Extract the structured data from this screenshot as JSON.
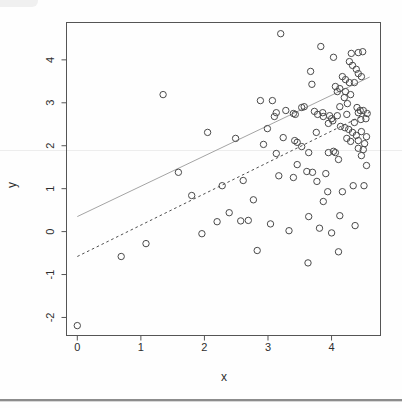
{
  "chart_data": {
    "type": "scatter",
    "title": "",
    "xlabel": "x",
    "ylabel": "y",
    "marker": "open-circle",
    "marker_color": "#4a4a4a",
    "axis_color": "#555555",
    "text_color": "#2e2e2e",
    "grid": false,
    "legend": false,
    "xlim": [
      -0.17,
      4.77
    ],
    "ylim": [
      -2.42,
      4.87
    ],
    "x_ticks": [
      0,
      1,
      2,
      3,
      4
    ],
    "x_tick_labels": [
      "0",
      "1",
      "2",
      "3",
      "4"
    ],
    "y_ticks": [
      -2,
      -1,
      0,
      1,
      2,
      3,
      4
    ],
    "y_tick_labels": [
      "-2",
      "-1",
      "0",
      "1",
      "2",
      "3",
      "4"
    ],
    "lines": [
      {
        "name": "solid-line",
        "style": "solid",
        "color": "#9a9a9a",
        "width": 0.9,
        "from": [
          0.0,
          0.35
        ],
        "to": [
          4.6,
          3.6
        ]
      },
      {
        "name": "dashed-line",
        "style": "dashed",
        "color": "#4f4f4f",
        "width": 1.0,
        "dash": "2.6,2.8",
        "from": [
          0.0,
          -0.58
        ],
        "to": [
          4.6,
          2.78
        ]
      }
    ],
    "points": [
      [
        0.0,
        -2.19
      ],
      [
        0.69,
        -0.58
      ],
      [
        1.08,
        -0.28
      ],
      [
        1.35,
        3.19
      ],
      [
        1.59,
        1.38
      ],
      [
        1.8,
        0.84
      ],
      [
        1.96,
        -0.05
      ],
      [
        2.05,
        2.31
      ],
      [
        2.2,
        0.23
      ],
      [
        2.28,
        1.07
      ],
      [
        2.39,
        0.44
      ],
      [
        2.49,
        2.17
      ],
      [
        2.57,
        0.25
      ],
      [
        2.61,
        1.19
      ],
      [
        2.69,
        0.26
      ],
      [
        2.77,
        0.74
      ],
      [
        2.83,
        -0.44
      ],
      [
        2.88,
        3.05
      ],
      [
        2.93,
        2.03
      ],
      [
        2.99,
        2.4
      ],
      [
        3.04,
        0.18
      ],
      [
        3.07,
        3.05
      ],
      [
        3.1,
        2.68
      ],
      [
        3.13,
        2.77
      ],
      [
        3.13,
        1.82
      ],
      [
        3.17,
        1.3
      ],
      [
        3.2,
        4.61
      ],
      [
        3.24,
        2.19
      ],
      [
        3.28,
        2.82
      ],
      [
        3.33,
        0.02
      ],
      [
        3.4,
        2.75
      ],
      [
        3.4,
        1.26
      ],
      [
        3.42,
        2.12
      ],
      [
        3.43,
        2.73
      ],
      [
        3.46,
        2.08
      ],
      [
        3.46,
        1.56
      ],
      [
        3.53,
        2.89
      ],
      [
        3.53,
        1.98
      ],
      [
        3.57,
        2.91
      ],
      [
        3.61,
        1.4
      ],
      [
        3.63,
        -0.73
      ],
      [
        3.64,
        1.84
      ],
      [
        3.64,
        0.35
      ],
      [
        3.67,
        3.73
      ],
      [
        3.69,
        3.43
      ],
      [
        3.7,
        1.38
      ],
      [
        3.73,
        2.8
      ],
      [
        3.76,
        2.31
      ],
      [
        3.77,
        1.17
      ],
      [
        3.78,
        2.73
      ],
      [
        3.81,
        0.08
      ],
      [
        3.83,
        4.31
      ],
      [
        3.86,
        2.77
      ],
      [
        3.87,
        2.68
      ],
      [
        3.87,
        0.7
      ],
      [
        3.91,
        1.35
      ],
      [
        3.94,
        0.93
      ],
      [
        3.95,
        1.84
      ],
      [
        3.95,
        2.52
      ],
      [
        3.97,
        2.7
      ],
      [
        4.0,
        -0.03
      ],
      [
        4.0,
        2.63
      ],
      [
        4.02,
        2.58
      ],
      [
        4.03,
        1.87
      ],
      [
        4.03,
        4.06
      ],
      [
        4.06,
        3.38
      ],
      [
        4.06,
        1.84
      ],
      [
        4.09,
        3.26
      ],
      [
        4.09,
        2.7
      ],
      [
        4.11,
        1.68
      ],
      [
        4.11,
        -0.47
      ],
      [
        4.13,
        0.37
      ],
      [
        4.13,
        2.91
      ],
      [
        4.13,
        3.33
      ],
      [
        4.14,
        2.45
      ],
      [
        4.17,
        0.93
      ],
      [
        4.17,
        3.61
      ],
      [
        4.2,
        3.12
      ],
      [
        4.21,
        2.42
      ],
      [
        4.22,
        3.54
      ],
      [
        4.22,
        3.26
      ],
      [
        4.24,
        2.73
      ],
      [
        4.24,
        2.17
      ],
      [
        4.25,
        2.98
      ],
      [
        4.27,
        2.38
      ],
      [
        4.28,
        3.47
      ],
      [
        4.28,
        3.96
      ],
      [
        4.3,
        3.19
      ],
      [
        4.3,
        2.1
      ],
      [
        4.31,
        4.15
      ],
      [
        4.33,
        3.87
      ],
      [
        4.33,
        2.31
      ],
      [
        4.34,
        1.07
      ],
      [
        4.36,
        3.47
      ],
      [
        4.36,
        2.54
      ],
      [
        4.37,
        0.14
      ],
      [
        4.39,
        3.78
      ],
      [
        4.39,
        2.24
      ],
      [
        4.4,
        2.89
      ],
      [
        4.42,
        4.17
      ],
      [
        4.42,
        3.68
      ],
      [
        4.42,
        2.77
      ],
      [
        4.42,
        2.12
      ],
      [
        4.42,
        1.94
      ],
      [
        4.45,
        2.82
      ],
      [
        4.46,
        2.61
      ],
      [
        4.47,
        3.61
      ],
      [
        4.47,
        2.33
      ],
      [
        4.47,
        1.77
      ],
      [
        4.49,
        4.19
      ],
      [
        4.5,
        1.91
      ],
      [
        4.5,
        2.82
      ],
      [
        4.51,
        1.07
      ],
      [
        4.52,
        2.05
      ],
      [
        4.54,
        2.63
      ],
      [
        4.55,
        2.21
      ],
      [
        4.55,
        1.54
      ],
      [
        4.56,
        2.75
      ]
    ]
  }
}
